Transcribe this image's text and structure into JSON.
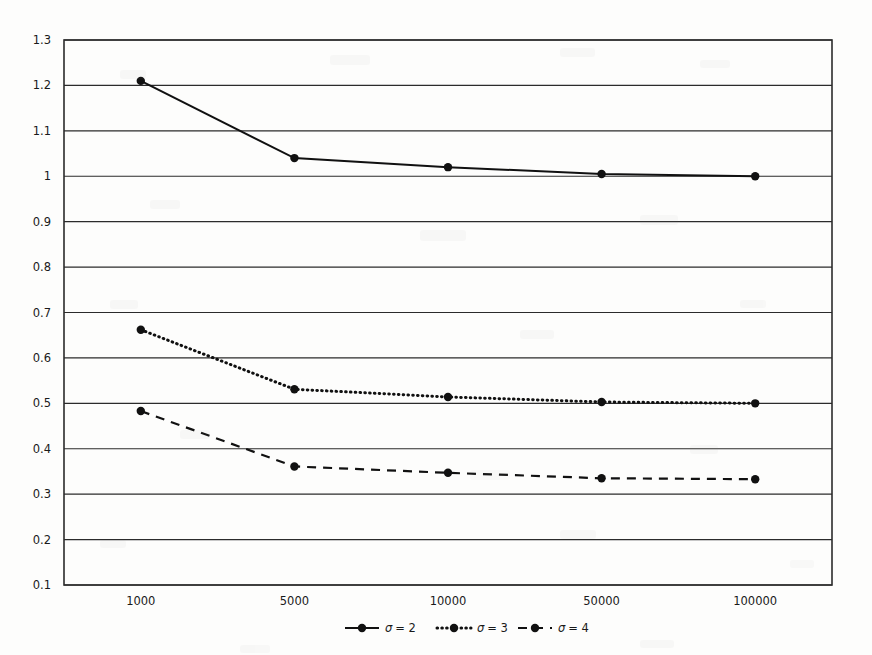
{
  "chart_data": {
    "type": "line",
    "title": "",
    "subtitle": "",
    "xlabel": "",
    "ylabel": "",
    "categories": [
      "1000",
      "5000",
      "10000",
      "50000",
      "100000"
    ],
    "ylim": [
      0.1,
      1.3
    ],
    "ytick_labels": [
      "1.3",
      "1.2",
      "1.1",
      "1",
      "0.9",
      "0.8",
      "0.7",
      "0.6",
      "0.5",
      "0.4",
      "0.3",
      "0.2",
      "0.1"
    ],
    "ytick_values": [
      1.3,
      1.2,
      1.1,
      1.0,
      0.9,
      0.8,
      0.7,
      0.6,
      0.5,
      0.4,
      0.3,
      0.2,
      0.1
    ],
    "grid": true,
    "legend_position": "bottom",
    "series": [
      {
        "name": "σ = 2",
        "label_prefix": "σ",
        "label_suffix": "= 2",
        "style": "solid",
        "values": [
          1.21,
          1.04,
          1.02,
          1.005,
          1.0
        ]
      },
      {
        "name": "σ = 3",
        "label_prefix": "σ",
        "label_suffix": "= 3",
        "style": "dotted",
        "values": [
          0.662,
          0.531,
          0.514,
          0.503,
          0.5
        ]
      },
      {
        "name": "σ = 4",
        "label_prefix": "σ",
        "label_suffix": "= 4",
        "style": "dashed",
        "values": [
          0.483,
          0.361,
          0.347,
          0.335,
          0.333
        ]
      }
    ],
    "colors": {
      "line": "#111111",
      "grid": "#2b2b2b",
      "border": "#2b2b2b",
      "background": "#fdfdfc",
      "text": "#1a1a1a"
    }
  }
}
